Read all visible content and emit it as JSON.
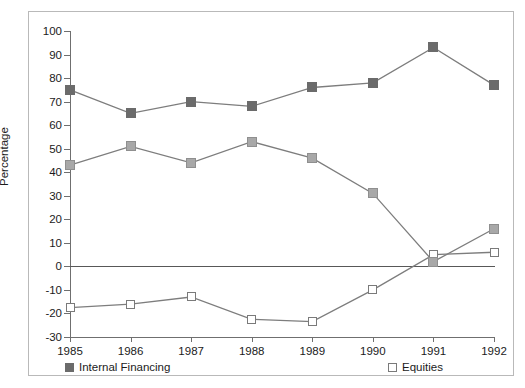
{
  "chart_data": {
    "type": "line",
    "title": "",
    "xlabel": "",
    "ylabel": "Percentage",
    "categories": [
      "1985",
      "1986",
      "1987",
      "1988",
      "1989",
      "1990",
      "1991",
      "1992"
    ],
    "ylim": [
      -30,
      100
    ],
    "ytick_labels": [
      "100",
      "90",
      "80",
      "70",
      "60",
      "50",
      "40",
      "30",
      "20",
      "10",
      "0",
      "-10",
      "-20",
      "-30"
    ],
    "ytick_values": [
      100,
      90,
      80,
      70,
      60,
      50,
      40,
      30,
      20,
      10,
      0,
      -10,
      -20,
      -30
    ],
    "grid": false,
    "legend_position": "bottom",
    "zero_line": 0,
    "series": [
      {
        "name": "Internal Financing",
        "marker": "filled-square",
        "color": "#6b6b6b",
        "values": [
          75,
          65,
          70,
          68,
          76,
          78,
          93,
          77
        ]
      },
      {
        "name": "Equities",
        "marker": "hollow-square",
        "color": "#ffffff",
        "values": [
          -17.5,
          -16,
          -13,
          -22.5,
          -23.5,
          -10,
          5,
          6
        ]
      },
      {
        "name": "Debt",
        "marker": "light-square",
        "color": "#a8a8a8",
        "values": [
          43,
          51,
          44,
          53,
          46,
          31,
          2,
          16
        ]
      }
    ]
  },
  "legend": {
    "entries": [
      {
        "label": "Internal Financing"
      },
      {
        "label": "Equities"
      },
      {
        "label": "Debt"
      }
    ]
  },
  "colors": {
    "internal_financing": "#6b6b6b",
    "equities_fill": "#ffffff",
    "equities_stroke": "#7a7a7a",
    "debt": "#a8a8a8",
    "line": "#7d7d7d",
    "axis": "#6f6f6f",
    "text": "#1b1b1b",
    "frame": "#b9b9b9",
    "background": "#ffffff"
  }
}
